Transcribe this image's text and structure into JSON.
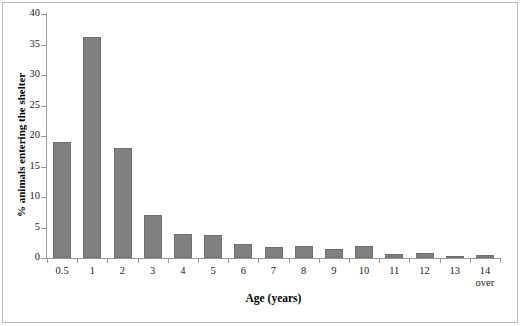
{
  "chart_data": {
    "type": "bar",
    "title": "",
    "xlabel": "Age (years)",
    "ylabel": "% animals entering the shelter",
    "categories": [
      "0.5",
      "1",
      "2",
      "3",
      "4",
      "5",
      "6",
      "7",
      "8",
      "9",
      "10",
      "11",
      "12",
      "13",
      "14"
    ],
    "category_sublabels": [
      "",
      "",
      "",
      "",
      "",
      "",
      "",
      "",
      "",
      "",
      "",
      "",
      "",
      "",
      "over"
    ],
    "values": [
      19.0,
      36.2,
      18.0,
      7.0,
      4.0,
      3.7,
      2.3,
      1.8,
      2.0,
      1.4,
      2.0,
      0.6,
      0.9,
      0.3,
      0.5
    ],
    "ylim": [
      0,
      40
    ],
    "yticks": [
      0,
      5,
      10,
      15,
      20,
      25,
      30,
      35,
      40
    ],
    "ytick_labels": [
      "0",
      "5",
      "10",
      "15",
      "20",
      "25",
      "30",
      "35",
      "40"
    ],
    "grid": false,
    "legend": false,
    "bar_color": "#808080",
    "bar_border_color": "#6f6f6f",
    "axis_color": "#9a9a9a",
    "text_color": "#1a1a1a",
    "background": "#ffffff"
  }
}
